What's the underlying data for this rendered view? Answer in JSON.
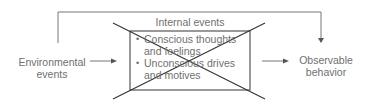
{
  "diagram": {
    "left_node": {
      "line1": "Environmental",
      "line2": "events"
    },
    "center_box": {
      "title": "Internal events",
      "items": [
        {
          "line1": "Conscious thoughts",
          "line2": "and feelings"
        },
        {
          "line1": "Unconscious drives",
          "line2": "and motives"
        }
      ],
      "crossed_out": true
    },
    "right_node": {
      "line1": "Observable",
      "line2": "behavior"
    },
    "bullet_glyph": "•",
    "colors": {
      "line": "#555555",
      "text": "#6f6f6f"
    }
  }
}
